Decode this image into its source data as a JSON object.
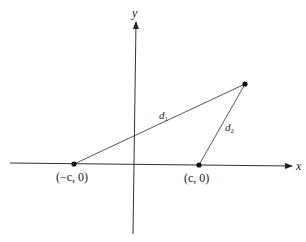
{
  "diagram": {
    "type": "coordinate-geometry",
    "axes": {
      "x_label": "x",
      "y_label": "y"
    },
    "points": [
      {
        "id": "focus-left",
        "label": "(−c, 0)",
        "px": [
          74,
          164
        ]
      },
      {
        "id": "focus-right",
        "label": "(c, 0)",
        "px": [
          199,
          165
        ]
      },
      {
        "id": "point-p",
        "label": "",
        "px": [
          245,
          84
        ]
      }
    ],
    "segments": [
      {
        "id": "d1",
        "from": "focus-left",
        "to": "point-p",
        "label": "d",
        "subscript": "1"
      },
      {
        "id": "d2",
        "from": "focus-right",
        "to": "point-p",
        "label": "d",
        "subscript": "2"
      }
    ],
    "colors": {
      "line": "#333333",
      "point": "#111111",
      "background": "#ffffff"
    }
  }
}
